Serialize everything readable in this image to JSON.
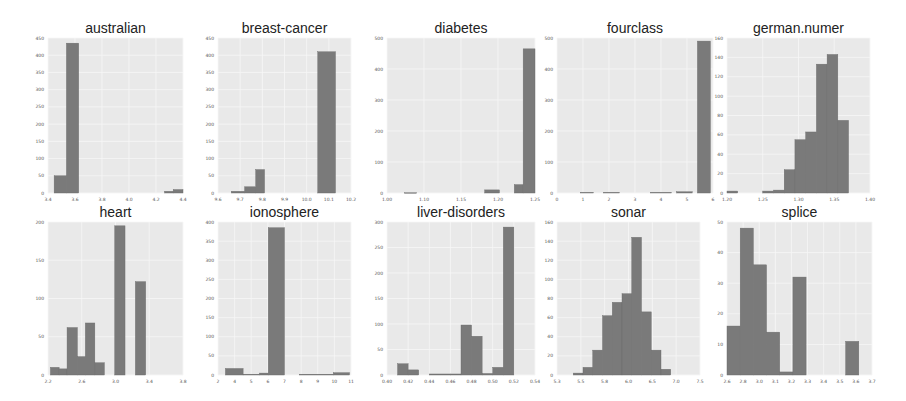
{
  "figure": {
    "colors": {
      "bar": "#7a7a7a",
      "plot_background": "#e9e9e9",
      "title": "#222222",
      "tick": "#555555"
    }
  },
  "chart_data": [
    {
      "type": "bar",
      "title": "australian",
      "xlabel": "",
      "ylabel": "",
      "xticks": [
        "3.4",
        "3.6",
        "3.8",
        "4.0",
        "4.2",
        "4.4"
      ],
      "xlim": [
        3.4,
        4.5
      ],
      "yticks": [
        "0",
        "50",
        "100",
        "150",
        "200",
        "250",
        "300",
        "350",
        "400",
        "450"
      ],
      "ylim": [
        0,
        450
      ],
      "grid": true,
      "bins": [
        {
          "x0": 3.45,
          "x1": 3.55,
          "value": 50
        },
        {
          "x0": 3.55,
          "x1": 3.65,
          "value": 435
        },
        {
          "x0": 4.35,
          "x1": 4.42,
          "value": 5
        },
        {
          "x0": 4.42,
          "x1": 4.5,
          "value": 10
        }
      ]
    },
    {
      "type": "bar",
      "title": "breast-cancer",
      "xlabel": "",
      "ylabel": "",
      "xticks": [
        "9.6",
        "9.7",
        "9.8",
        "9.9",
        "10.0",
        "10.1",
        "10.2"
      ],
      "xlim": [
        9.6,
        10.2
      ],
      "yticks": [
        "0",
        "50",
        "100",
        "150",
        "200",
        "250",
        "300",
        "350",
        "400",
        "450"
      ],
      "ylim": [
        0,
        450
      ],
      "grid": true,
      "bins": [
        {
          "x0": 9.66,
          "x1": 9.72,
          "value": 5
        },
        {
          "x0": 9.72,
          "x1": 9.77,
          "value": 18
        },
        {
          "x0": 9.77,
          "x1": 9.81,
          "value": 68
        },
        {
          "x0": 10.05,
          "x1": 10.13,
          "value": 410
        }
      ]
    },
    {
      "type": "bar",
      "title": "diabetes",
      "xlabel": "",
      "ylabel": "",
      "xticks": [
        "1.00",
        "1.10",
        "1.15",
        "1.20",
        "1.25"
      ],
      "xlim": [
        1.0,
        1.25
      ],
      "yticks": [
        "0",
        "100",
        "200",
        "300",
        "400",
        "500"
      ],
      "ylim": [
        0,
        500
      ],
      "grid": true,
      "bins": [
        {
          "x0": 1.03,
          "x1": 1.05,
          "value": 1
        },
        {
          "x0": 1.165,
          "x1": 1.19,
          "value": 10
        },
        {
          "x0": 1.215,
          "x1": 1.23,
          "value": 27
        },
        {
          "x0": 1.23,
          "x1": 1.25,
          "value": 465
        }
      ]
    },
    {
      "type": "bar",
      "title": "fourclass",
      "xlabel": "",
      "ylabel": "",
      "xticks": [
        "0",
        "1",
        "2",
        "3",
        "4",
        "5",
        "6"
      ],
      "xlim": [
        0,
        6
      ],
      "yticks": [
        "0",
        "100",
        "200",
        "300",
        "400",
        "500"
      ],
      "ylim": [
        0,
        500
      ],
      "grid": true,
      "bins": [
        {
          "x0": 0.9,
          "x1": 1.4,
          "value": 2
        },
        {
          "x0": 1.8,
          "x1": 2.4,
          "value": 2
        },
        {
          "x0": 3.6,
          "x1": 4.4,
          "value": 2
        },
        {
          "x0": 4.6,
          "x1": 5.2,
          "value": 4
        },
        {
          "x0": 5.4,
          "x1": 5.9,
          "value": 490
        }
      ]
    },
    {
      "type": "bar",
      "title": "german.numer",
      "xlabel": "",
      "ylabel": "",
      "xticks": [
        "1.20",
        "1.25",
        "1.30",
        "1.35",
        "1.40"
      ],
      "xlim": [
        1.2,
        1.4
      ],
      "yticks": [
        "0",
        "20",
        "40",
        "60",
        "80",
        "100",
        "120",
        "140",
        "160"
      ],
      "ylim": [
        0,
        160
      ],
      "grid": true,
      "bins": [
        {
          "x0": 1.2,
          "x1": 1.215,
          "value": 2
        },
        {
          "x0": 1.25,
          "x1": 1.265,
          "value": 2
        },
        {
          "x0": 1.265,
          "x1": 1.28,
          "value": 3
        },
        {
          "x0": 1.28,
          "x1": 1.295,
          "value": 24
        },
        {
          "x0": 1.295,
          "x1": 1.31,
          "value": 55
        },
        {
          "x0": 1.31,
          "x1": 1.325,
          "value": 63
        },
        {
          "x0": 1.325,
          "x1": 1.34,
          "value": 133
        },
        {
          "x0": 1.34,
          "x1": 1.355,
          "value": 143
        },
        {
          "x0": 1.355,
          "x1": 1.37,
          "value": 75
        }
      ]
    },
    {
      "type": "bar",
      "title": "heart",
      "xlabel": "",
      "ylabel": "",
      "xticks": [
        "2.2",
        "2.6",
        "3.0",
        "3.4",
        "3.8"
      ],
      "xlim": [
        2.1,
        3.8
      ],
      "yticks": [
        "0",
        "50",
        "100",
        "150",
        "200"
      ],
      "ylim": [
        0,
        200
      ],
      "grid": true,
      "bins": [
        {
          "x0": 2.13,
          "x1": 2.24,
          "value": 10
        },
        {
          "x0": 2.24,
          "x1": 2.34,
          "value": 8
        },
        {
          "x0": 2.34,
          "x1": 2.47,
          "value": 62
        },
        {
          "x0": 2.47,
          "x1": 2.57,
          "value": 24
        },
        {
          "x0": 2.57,
          "x1": 2.69,
          "value": 68
        },
        {
          "x0": 2.69,
          "x1": 2.81,
          "value": 16
        },
        {
          "x0": 2.94,
          "x1": 3.07,
          "value": 195
        },
        {
          "x0": 3.2,
          "x1": 3.33,
          "value": 122
        }
      ]
    },
    {
      "type": "bar",
      "title": "ionosphere",
      "xlabel": "",
      "ylabel": "",
      "xticks": [
        "2",
        "4",
        "5",
        "6",
        "7",
        "8",
        "9",
        "10",
        "11"
      ],
      "xlim": [
        2,
        11
      ],
      "yticks": [
        "0",
        "50",
        "100",
        "150",
        "200",
        "250",
        "300",
        "350",
        "400"
      ],
      "ylim": [
        0,
        400
      ],
      "grid": true,
      "bins": [
        {
          "x0": 2.5,
          "x1": 3.7,
          "value": 17
        },
        {
          "x0": 3.7,
          "x1": 4.8,
          "value": 2
        },
        {
          "x0": 4.8,
          "x1": 5.4,
          "value": 5
        },
        {
          "x0": 5.4,
          "x1": 6.5,
          "value": 385
        },
        {
          "x0": 7.5,
          "x1": 9.8,
          "value": 2
        },
        {
          "x0": 9.8,
          "x1": 10.9,
          "value": 6
        }
      ]
    },
    {
      "type": "bar",
      "title": "liver-disorders",
      "xlabel": "",
      "ylabel": "",
      "xticks": [
        "0.40",
        "0.42",
        "0.44",
        "0.46",
        "0.48",
        "0.50",
        "0.52",
        "0.54"
      ],
      "xlim": [
        0.4,
        0.54
      ],
      "yticks": [
        "0",
        "50",
        "100",
        "150",
        "200",
        "250",
        "300"
      ],
      "ylim": [
        0,
        300
      ],
      "grid": true,
      "bins": [
        {
          "x0": 0.41,
          "x1": 0.42,
          "value": 22
        },
        {
          "x0": 0.42,
          "x1": 0.43,
          "value": 10
        },
        {
          "x0": 0.44,
          "x1": 0.46,
          "value": 2
        },
        {
          "x0": 0.46,
          "x1": 0.47,
          "value": 2
        },
        {
          "x0": 0.47,
          "x1": 0.48,
          "value": 98
        },
        {
          "x0": 0.48,
          "x1": 0.49,
          "value": 76
        },
        {
          "x0": 0.49,
          "x1": 0.5,
          "value": 3
        },
        {
          "x0": 0.5,
          "x1": 0.51,
          "value": 15
        },
        {
          "x0": 0.51,
          "x1": 0.52,
          "value": 290
        }
      ]
    },
    {
      "type": "bar",
      "title": "sonar",
      "xlabel": "",
      "ylabel": "",
      "xticks": [
        "5.3",
        "5.5",
        "5.8",
        "6.0",
        "6.5",
        "7.0",
        "7.5"
      ],
      "xlim": [
        5.3,
        7.5
      ],
      "yticks": [
        "0",
        "20",
        "40",
        "60",
        "80",
        "100",
        "120",
        "140",
        "160"
      ],
      "ylim": [
        0,
        160
      ],
      "grid": true,
      "bins": [
        {
          "x0": 5.55,
          "x1": 5.7,
          "value": 2
        },
        {
          "x0": 5.7,
          "x1": 5.85,
          "value": 8
        },
        {
          "x0": 5.85,
          "x1": 6.0,
          "value": 26
        },
        {
          "x0": 6.0,
          "x1": 6.15,
          "value": 62
        },
        {
          "x0": 6.15,
          "x1": 6.3,
          "value": 76
        },
        {
          "x0": 6.3,
          "x1": 6.45,
          "value": 85
        },
        {
          "x0": 6.45,
          "x1": 6.6,
          "value": 144
        },
        {
          "x0": 6.6,
          "x1": 6.75,
          "value": 66
        },
        {
          "x0": 6.75,
          "x1": 6.9,
          "value": 26
        },
        {
          "x0": 6.9,
          "x1": 7.05,
          "value": 6
        }
      ]
    },
    {
      "type": "bar",
      "title": "splice",
      "xlabel": "",
      "ylabel": "",
      "xticks": [
        "2.6",
        "2.8",
        "3.0",
        "3.1",
        "3.2",
        "3.3",
        "3.4",
        "3.5",
        "3.6",
        "3.7"
      ],
      "xlim": [
        2.6,
        3.7
      ],
      "yticks": [
        "0",
        "10",
        "20",
        "30",
        "40",
        "50"
      ],
      "ylim": [
        0,
        50
      ],
      "grid": true,
      "bins": [
        {
          "x0": 2.6,
          "x1": 2.7,
          "value": 16
        },
        {
          "x0": 2.7,
          "x1": 2.8,
          "value": 48
        },
        {
          "x0": 2.8,
          "x1": 2.9,
          "value": 36
        },
        {
          "x0": 2.9,
          "x1": 3.0,
          "value": 14
        },
        {
          "x0": 3.0,
          "x1": 3.1,
          "value": 1
        },
        {
          "x0": 3.1,
          "x1": 3.2,
          "value": 32
        },
        {
          "x0": 3.5,
          "x1": 3.6,
          "value": 11
        }
      ]
    }
  ],
  "layout": {
    "panels": [
      {
        "x": 48,
        "y": 38,
        "w": 135,
        "h": 155
      },
      {
        "x": 218,
        "y": 38,
        "w": 133,
        "h": 155
      },
      {
        "x": 387,
        "y": 38,
        "w": 148,
        "h": 155
      },
      {
        "x": 557,
        "y": 38,
        "w": 156,
        "h": 155
      },
      {
        "x": 727,
        "y": 38,
        "w": 143,
        "h": 155
      },
      {
        "x": 48,
        "y": 222,
        "w": 135,
        "h": 153
      },
      {
        "x": 218,
        "y": 222,
        "w": 133,
        "h": 153
      },
      {
        "x": 387,
        "y": 222,
        "w": 148,
        "h": 153
      },
      {
        "x": 557,
        "y": 222,
        "w": 143,
        "h": 153
      },
      {
        "x": 727,
        "y": 222,
        "w": 145,
        "h": 153
      }
    ]
  }
}
